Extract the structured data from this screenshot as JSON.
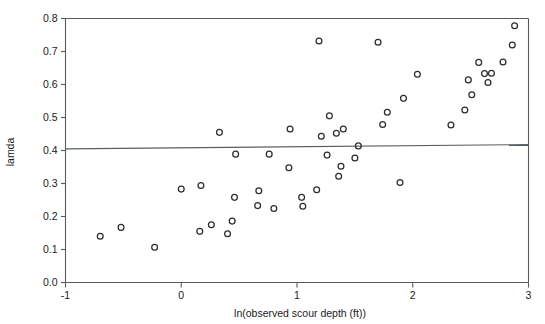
{
  "chart_data": {
    "type": "scatter",
    "title": "",
    "xlabel": "ln(observed scour depth (ft))",
    "ylabel": "lamda",
    "xlim": [
      -1,
      3
    ],
    "ylim": [
      0.0,
      0.8
    ],
    "xticks": [
      "-1",
      "0",
      "1",
      "2",
      "3"
    ],
    "xtick_values": [
      -1,
      0,
      1,
      2,
      3
    ],
    "yticks": [
      "0.0",
      "0.1",
      "0.2",
      "0.3",
      "0.4",
      "0.5",
      "0.6",
      "0.7",
      "0.8"
    ],
    "ytick_values": [
      0.0,
      0.1,
      0.2,
      0.3,
      0.4,
      0.5,
      0.6,
      0.7,
      0.8
    ],
    "grid": false,
    "legend": null,
    "marker": "open-circle",
    "marker_color": "#2b2b2b",
    "reference_line": {
      "name": "horizontal-threshold-line",
      "type": "line",
      "y_start": 0.405,
      "y_end": 0.418,
      "x_start": -1,
      "x_end": 3,
      "color": "#585f62"
    },
    "points": [
      {
        "x": -0.7,
        "y": 0.14
      },
      {
        "x": -0.52,
        "y": 0.167
      },
      {
        "x": -0.23,
        "y": 0.107
      },
      {
        "x": 0.0,
        "y": 0.283
      },
      {
        "x": 0.16,
        "y": 0.155
      },
      {
        "x": 0.17,
        "y": 0.294
      },
      {
        "x": 0.26,
        "y": 0.175
      },
      {
        "x": 0.33,
        "y": 0.455
      },
      {
        "x": 0.4,
        "y": 0.148
      },
      {
        "x": 0.44,
        "y": 0.186
      },
      {
        "x": 0.46,
        "y": 0.258
      },
      {
        "x": 0.47,
        "y": 0.389
      },
      {
        "x": 0.66,
        "y": 0.233
      },
      {
        "x": 0.67,
        "y": 0.278
      },
      {
        "x": 0.76,
        "y": 0.389
      },
      {
        "x": 0.8,
        "y": 0.224
      },
      {
        "x": 0.93,
        "y": 0.348
      },
      {
        "x": 0.94,
        "y": 0.465
      },
      {
        "x": 1.04,
        "y": 0.258
      },
      {
        "x": 1.05,
        "y": 0.231
      },
      {
        "x": 1.17,
        "y": 0.281
      },
      {
        "x": 1.19,
        "y": 0.732
      },
      {
        "x": 1.21,
        "y": 0.443
      },
      {
        "x": 1.26,
        "y": 0.386
      },
      {
        "x": 1.28,
        "y": 0.505
      },
      {
        "x": 1.34,
        "y": 0.452
      },
      {
        "x": 1.36,
        "y": 0.322
      },
      {
        "x": 1.38,
        "y": 0.352
      },
      {
        "x": 1.4,
        "y": 0.465
      },
      {
        "x": 1.5,
        "y": 0.377
      },
      {
        "x": 1.53,
        "y": 0.414
      },
      {
        "x": 1.7,
        "y": 0.728
      },
      {
        "x": 1.74,
        "y": 0.479
      },
      {
        "x": 1.78,
        "y": 0.516
      },
      {
        "x": 1.89,
        "y": 0.303
      },
      {
        "x": 1.92,
        "y": 0.558
      },
      {
        "x": 2.04,
        "y": 0.631
      },
      {
        "x": 2.33,
        "y": 0.477
      },
      {
        "x": 2.45,
        "y": 0.523
      },
      {
        "x": 2.48,
        "y": 0.614
      },
      {
        "x": 2.51,
        "y": 0.569
      },
      {
        "x": 2.57,
        "y": 0.667
      },
      {
        "x": 2.62,
        "y": 0.633
      },
      {
        "x": 2.65,
        "y": 0.606
      },
      {
        "x": 2.68,
        "y": 0.634
      },
      {
        "x": 2.78,
        "y": 0.668
      },
      {
        "x": 2.86,
        "y": 0.72
      },
      {
        "x": 2.88,
        "y": 0.778
      }
    ]
  }
}
